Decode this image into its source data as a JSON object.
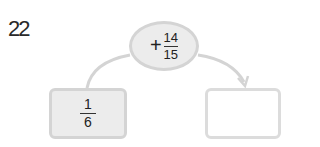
{
  "problem": {
    "number": "22",
    "operation": {
      "operator": "+",
      "numerator": "14",
      "denominator": "15"
    },
    "start_value": {
      "numerator": "1",
      "denominator": "6"
    },
    "result_value": ""
  },
  "colors": {
    "shape_fill": "#ececec",
    "shape_border": "#d4d4d4",
    "arrow": "#d4d4d4",
    "text": "#222222"
  }
}
